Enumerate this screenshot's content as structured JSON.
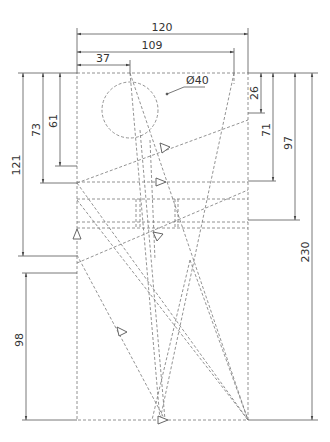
{
  "drawing": {
    "type": "technical-dimension-drawing",
    "dimensions": {
      "width_total": "120",
      "width_109": "109",
      "width_37": "37",
      "diameter": "Ø40",
      "left_121": "121",
      "left_73": "73",
      "left_61": "61",
      "left_98": "98",
      "right_26": "26",
      "right_71": "71",
      "right_97": "97",
      "right_230": "230"
    },
    "colors": {
      "line": "#555555",
      "dashed": "#777777",
      "text": "#333333"
    }
  }
}
